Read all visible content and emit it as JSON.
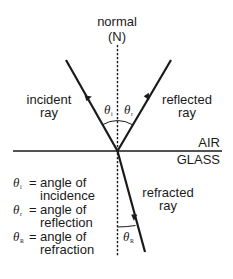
{
  "diagram": {
    "normal": {
      "label_line1": "normal",
      "label_line2": "(N)"
    },
    "media": {
      "upper": "AIR",
      "lower": "GLASS"
    },
    "rays": {
      "incident": {
        "line1": "incident",
        "line2": "ray"
      },
      "reflected": {
        "line1": "reflected",
        "line2": "ray"
      },
      "refracted": {
        "line1": "refracted",
        "line2": "ray"
      }
    },
    "angles": {
      "incidence": {
        "symbol": "θ",
        "subscript": "i"
      },
      "reflection": {
        "symbol": "θ",
        "subscript": "r"
      },
      "refraction": {
        "symbol": "θ",
        "subscript": "R"
      }
    },
    "legend": [
      {
        "symbol": "θ",
        "subscript": "i",
        "equals": "=",
        "line1": "angle of",
        "line2": "incidence"
      },
      {
        "symbol": "θ",
        "subscript": "r",
        "equals": "=",
        "line1": "angle of",
        "line2": "reflection"
      },
      {
        "symbol": "θ",
        "subscript": "R",
        "equals": "=",
        "line1": "angle of",
        "line2": "refraction"
      }
    ],
    "colors": {
      "ink": "#1a1a1a",
      "background": "#ffffff"
    }
  }
}
